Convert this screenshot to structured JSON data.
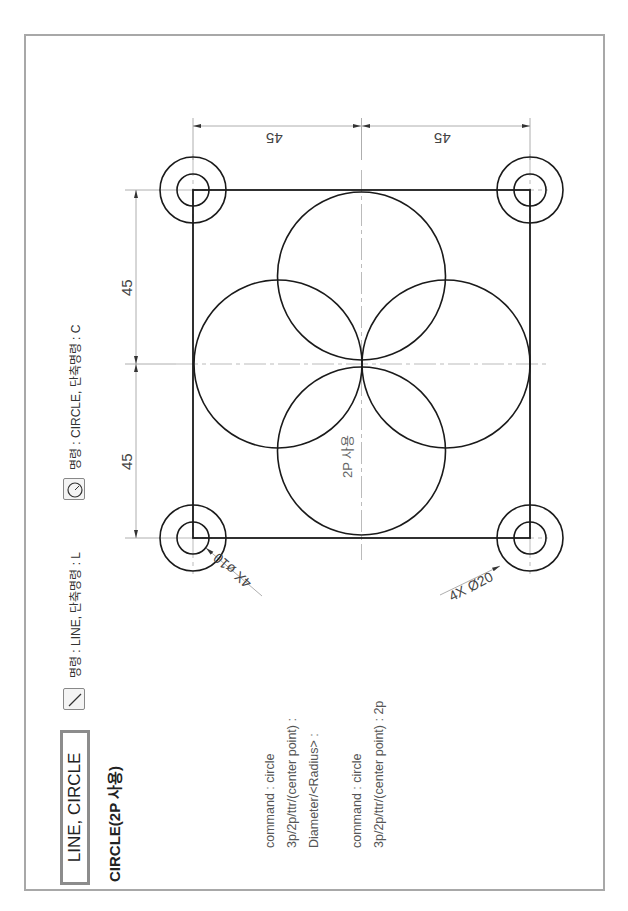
{
  "header": {
    "title": "LINE, CIRCLE",
    "subtitle": "CIRCLE(2P 사용)"
  },
  "commands": [
    {
      "icon": "line-icon",
      "label": "명령 : LINE, 단축명령 : L"
    },
    {
      "icon": "circle-icon",
      "label": "명령 : CIRCLE, 단축명령 : C"
    }
  ],
  "command_log": {
    "block1": [
      "command : circle",
      "3p/2p/ttr/(center point) :",
      "Diameter/<Radius> :"
    ],
    "block2": [
      "command : circle",
      "3p/2p/ttr/(center point) : 2p"
    ]
  },
  "drawing": {
    "dimensions": {
      "left_top": "45",
      "left_bottom": "45",
      "top_left": "45",
      "top_right": "45"
    },
    "notes": {
      "small_hole": "4X ø10",
      "large_hole": "4X Ø20",
      "circle_method": "2P 사용"
    }
  },
  "colors": {
    "frame": "#a8a8a8",
    "line": "#1a1a1a",
    "dim": "#888888",
    "center": "#aaaaaa"
  }
}
